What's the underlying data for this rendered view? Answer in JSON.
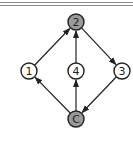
{
  "diagram": {
    "type": "directed-graph",
    "nodes": [
      {
        "id": "2",
        "label": "2",
        "x": 76,
        "y": 22,
        "shaded": true
      },
      {
        "id": "1",
        "label": "1",
        "x": 29,
        "y": 71,
        "shaded": false
      },
      {
        "id": "4",
        "label": "4",
        "x": 76,
        "y": 71,
        "shaded": false
      },
      {
        "id": "3",
        "label": "3",
        "x": 122,
        "y": 71,
        "shaded": false
      },
      {
        "id": "C",
        "label": "C",
        "x": 76,
        "y": 119,
        "shaded": true
      }
    ],
    "edges": [
      {
        "from": "C",
        "to": "1"
      },
      {
        "from": "C",
        "to": "4"
      },
      {
        "from": "1",
        "to": "2"
      },
      {
        "from": "4",
        "to": "2"
      },
      {
        "from": "2",
        "to": "3"
      },
      {
        "from": "3",
        "to": "C"
      }
    ],
    "colors": {
      "stroke": "#222222",
      "shaded_fill": "#9a9a9a",
      "plain_fill": "#ffffff",
      "rule": "#8a8a8a"
    }
  }
}
